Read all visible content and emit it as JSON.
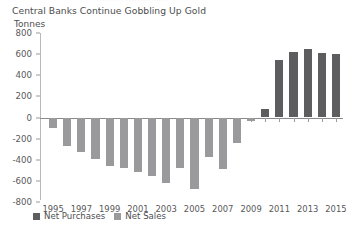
{
  "clipped_header": "··························",
  "chart_data": {
    "type": "bar",
    "title": "Central Banks Continue Gobbling Up Gold",
    "subtitle": "",
    "ylabel": "Tonnes",
    "xlabel": "",
    "ylim": [
      -800,
      800
    ],
    "ytick_values": [
      800,
      600,
      400,
      200,
      0,
      -200,
      -400,
      -600,
      -800
    ],
    "ytick_labels": [
      "800",
      "600",
      "400",
      "200",
      "0",
      "-200",
      "-400",
      "-600",
      "-800"
    ],
    "xtick_labels": [
      "1995",
      "1997",
      "1999",
      "2001",
      "2003",
      "2005",
      "2007",
      "2009",
      "2011",
      "2013",
      "2015"
    ],
    "grid": false,
    "legend_position": "bottom-left",
    "legend": [
      {
        "name": "Net Purchases",
        "color": "#5d5d60"
      },
      {
        "name": "Net Sales",
        "color": "#9a9a9c"
      }
    ],
    "categories": [
      1995,
      1996,
      1997,
      1998,
      1999,
      2000,
      2001,
      2002,
      2003,
      2004,
      2005,
      2006,
      2007,
      2008,
      2009,
      2010,
      2011,
      2012,
      2013,
      2014,
      2015
    ],
    "values": [
      -100,
      -270,
      -330,
      -390,
      -460,
      -480,
      -520,
      -550,
      -620,
      -480,
      -680,
      -370,
      -490,
      -240,
      -35,
      80,
      545,
      620,
      645,
      610,
      605
    ],
    "series": [
      {
        "name": "Net Sales",
        "color": "#9a9a9c",
        "points": [
          {
            "year": 1995,
            "value": -100
          },
          {
            "year": 1996,
            "value": -270
          },
          {
            "year": 1997,
            "value": -330
          },
          {
            "year": 1998,
            "value": -390
          },
          {
            "year": 1999,
            "value": -460
          },
          {
            "year": 2000,
            "value": -480
          },
          {
            "year": 2001,
            "value": -520
          },
          {
            "year": 2002,
            "value": -550
          },
          {
            "year": 2003,
            "value": -620
          },
          {
            "year": 2004,
            "value": -480
          },
          {
            "year": 2005,
            "value": -680
          },
          {
            "year": 2006,
            "value": -370
          },
          {
            "year": 2007,
            "value": -490
          },
          {
            "year": 2008,
            "value": -240
          },
          {
            "year": 2009,
            "value": -35
          }
        ]
      },
      {
        "name": "Net Purchases",
        "color": "#5d5d60",
        "points": [
          {
            "year": 2010,
            "value": 80
          },
          {
            "year": 2011,
            "value": 545
          },
          {
            "year": 2012,
            "value": 620
          },
          {
            "year": 2013,
            "value": 645
          },
          {
            "year": 2014,
            "value": 610
          },
          {
            "year": 2015,
            "value": 605
          }
        ]
      }
    ]
  }
}
